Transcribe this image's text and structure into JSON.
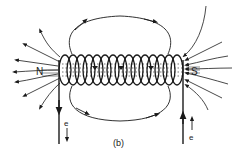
{
  "figure": {
    "caption": "(b)",
    "colors": {
      "ink": "#1a1a1a",
      "background": "#ffffff"
    }
  },
  "labels": {
    "north_pole": "N",
    "south_pole": "S",
    "electron_left": "e",
    "electron_right": "e"
  },
  "coil": {
    "turns": 14
  }
}
